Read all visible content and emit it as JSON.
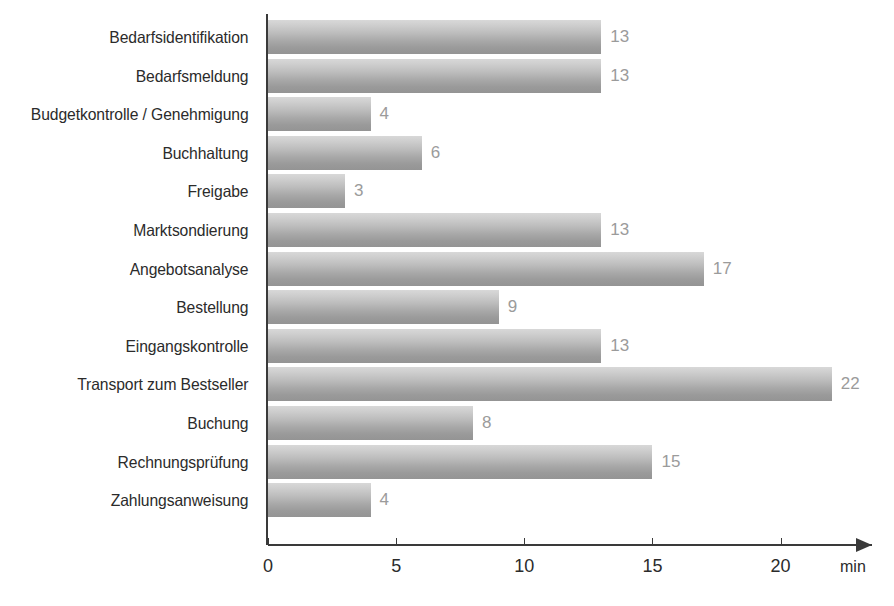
{
  "chart_data": {
    "type": "bar",
    "orientation": "horizontal",
    "title": "",
    "xlabel": "min",
    "ylabel": "",
    "xlim": [
      0,
      23.6
    ],
    "grid": false,
    "legend": null,
    "categories": [
      "Bedarfsidentifikation",
      "Bedarfsmeldung",
      "Budgetkontrolle / Genehmigung",
      "Buchhaltung",
      "Freigabe",
      "Marktsondierung",
      "Angebotsanalyse",
      "Bestellung",
      "Eingangskontrolle",
      "Transport zum Bestseller",
      "Buchung",
      "Rechnungsprüfung",
      "Zahlungsanweisung"
    ],
    "values": [
      13,
      13,
      4,
      6,
      3,
      13,
      17,
      9,
      13,
      22,
      8,
      15,
      4
    ],
    "value_labels": [
      "13",
      "13",
      "4",
      "6",
      "3",
      "13",
      "17",
      "9",
      "13",
      "22",
      "8",
      "15",
      "4"
    ],
    "xticks": [
      0,
      5,
      10,
      15,
      20
    ],
    "xtick_labels": [
      "0",
      "5",
      "10",
      "15",
      "20"
    ],
    "unit": "min",
    "colors": {
      "bar_gradient_top": "#d8d8d8",
      "bar_gradient_bottom": "#949494",
      "axis": "#3a3a3a",
      "category_label": "#2b2b2b",
      "value_label": "#9b9b9b",
      "background": "#ffffff"
    }
  }
}
